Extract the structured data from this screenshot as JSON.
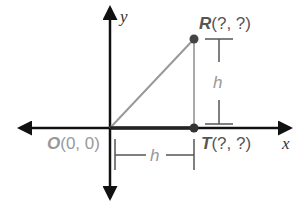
{
  "diagram": {
    "axes": {
      "x_label": "x",
      "y_label": "y"
    },
    "points": {
      "O": {
        "name": "O",
        "coords": "(0, 0)"
      },
      "R": {
        "name": "R",
        "coords": "(?, ?)"
      },
      "T": {
        "name": "T",
        "coords": "(?, ?)"
      }
    },
    "dimensions": {
      "vertical": "h",
      "horizontal": "h"
    },
    "colors": {
      "axis": "#111111",
      "segment_OT": "#333333",
      "segment_OR": "#999999",
      "segment_RT": "#aaaaaa",
      "point": "#444444",
      "label": "#555555"
    }
  }
}
